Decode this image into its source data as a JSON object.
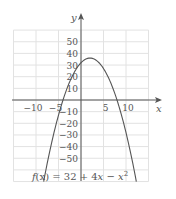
{
  "chart_data": {
    "type": "line",
    "title": "",
    "function": "f(x) = 32 + 4x - x^2",
    "caption": "f(x) = 32 + 4x − x²",
    "xlabel": "x",
    "ylabel": "y",
    "xlim": [
      -15,
      15
    ],
    "ylim": [
      -70,
      60
    ],
    "grid": true,
    "x_ticks": [
      -10,
      -5,
      5,
      10
    ],
    "x_tick_labels": [
      "−10",
      "−5",
      "5",
      "10"
    ],
    "y_ticks": [
      50,
      40,
      30,
      20,
      10,
      -10,
      -20,
      -30,
      -40,
      -50
    ],
    "y_tick_labels": [
      "50",
      "40",
      "30",
      "20",
      "10",
      "−10",
      "−20",
      "−30",
      "−40",
      "−50"
    ],
    "series": [
      {
        "name": "f(x) = 32 + 4x − x²",
        "x": [
          -8,
          -6,
          -4,
          -2,
          0,
          2,
          4,
          6,
          8,
          10,
          12
        ],
        "y": [
          -64,
          -28,
          0,
          20,
          32,
          36,
          32,
          20,
          0,
          -28,
          -64
        ]
      }
    ],
    "vertex": [
      2,
      36
    ],
    "roots": [
      -4,
      8
    ],
    "y_intercept": 32
  },
  "labels": {
    "caption_prefix": "f",
    "caption_var": "(x)",
    "caption_rest": " = 32 + 4",
    "caption_x": "x",
    "caption_minus": " − ",
    "caption_x2": "x",
    "caption_sup": "2"
  },
  "colors": {
    "grid": "#e2e2e2",
    "axis": "#555555",
    "curve": "#555555",
    "text": "#555555"
  }
}
